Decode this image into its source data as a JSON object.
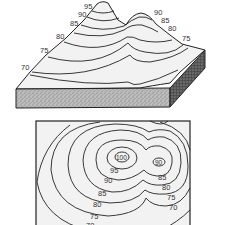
{
  "figure": {
    "top_panel": {
      "title": "3D block view of two hills",
      "left_peak_labels": [
        "95",
        "90",
        "85",
        "80",
        "75",
        "70"
      ],
      "right_peak_labels": [
        "90",
        "85",
        "80",
        "75"
      ]
    },
    "bottom_panel": {
      "title": "Contour map",
      "peak_labels": [
        "100",
        "90"
      ],
      "contour_labels_left": [
        "95",
        "90",
        "85",
        "80",
        "75",
        "70"
      ],
      "contour_labels_right": [
        "85",
        "80",
        "75",
        "70"
      ]
    }
  }
}
